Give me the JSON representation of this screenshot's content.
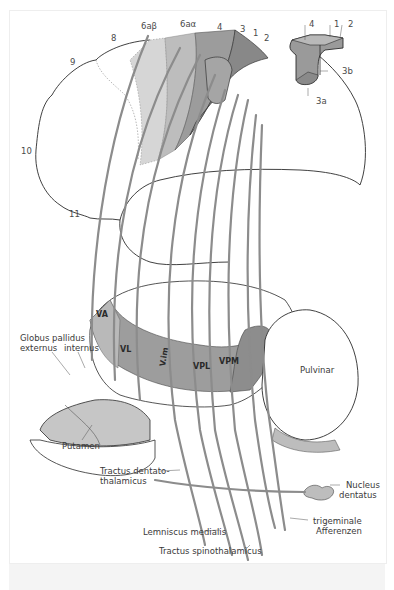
{
  "figure": {
    "cortex_area_labels": {
      "area_8": "8",
      "area_9": "9",
      "area_10": "10",
      "area_11": "11",
      "area_6ab": "6aβ",
      "area_6aa": "6aα",
      "area_4": "4",
      "area_3": "3",
      "area_1": "1",
      "area_2": "2"
    },
    "inset_labels": {
      "area_4": "4",
      "area_1": "1",
      "area_2": "2",
      "area_3b": "3b",
      "area_3a": "3a"
    },
    "thalamic_nuclei": {
      "va": "VA",
      "vl": "VL",
      "vim": "V.im",
      "vpl": "VPL",
      "vpm": "VPM"
    },
    "structures": {
      "globus_pallidus": "Globus pallidus",
      "externus": "externus",
      "internus": "internus",
      "putamen": "Putamen",
      "pulvinar": "Pulvinar",
      "tractus_dentatothalamicus_1": "Tractus dentato-",
      "tractus_dentatothalamicus_2": "thalamicus",
      "nucleus_dentatus_1": "Nucleus",
      "nucleus_dentatus_2": "dentatus",
      "lemniscus_medialis": "Lemniscus medialis",
      "trigeminale_1": "trigeminale",
      "trigeminale_2": "Afferenzen",
      "tractus_spinothalamicus": "Tractus spinothalamicus"
    },
    "colors": {
      "dark_gray": "#8a8a8a",
      "mid_gray": "#a9a9a9",
      "light_gray": "#cfcfcf",
      "fiber": "#8c8c8c",
      "outline": "#2b2b2b"
    }
  }
}
